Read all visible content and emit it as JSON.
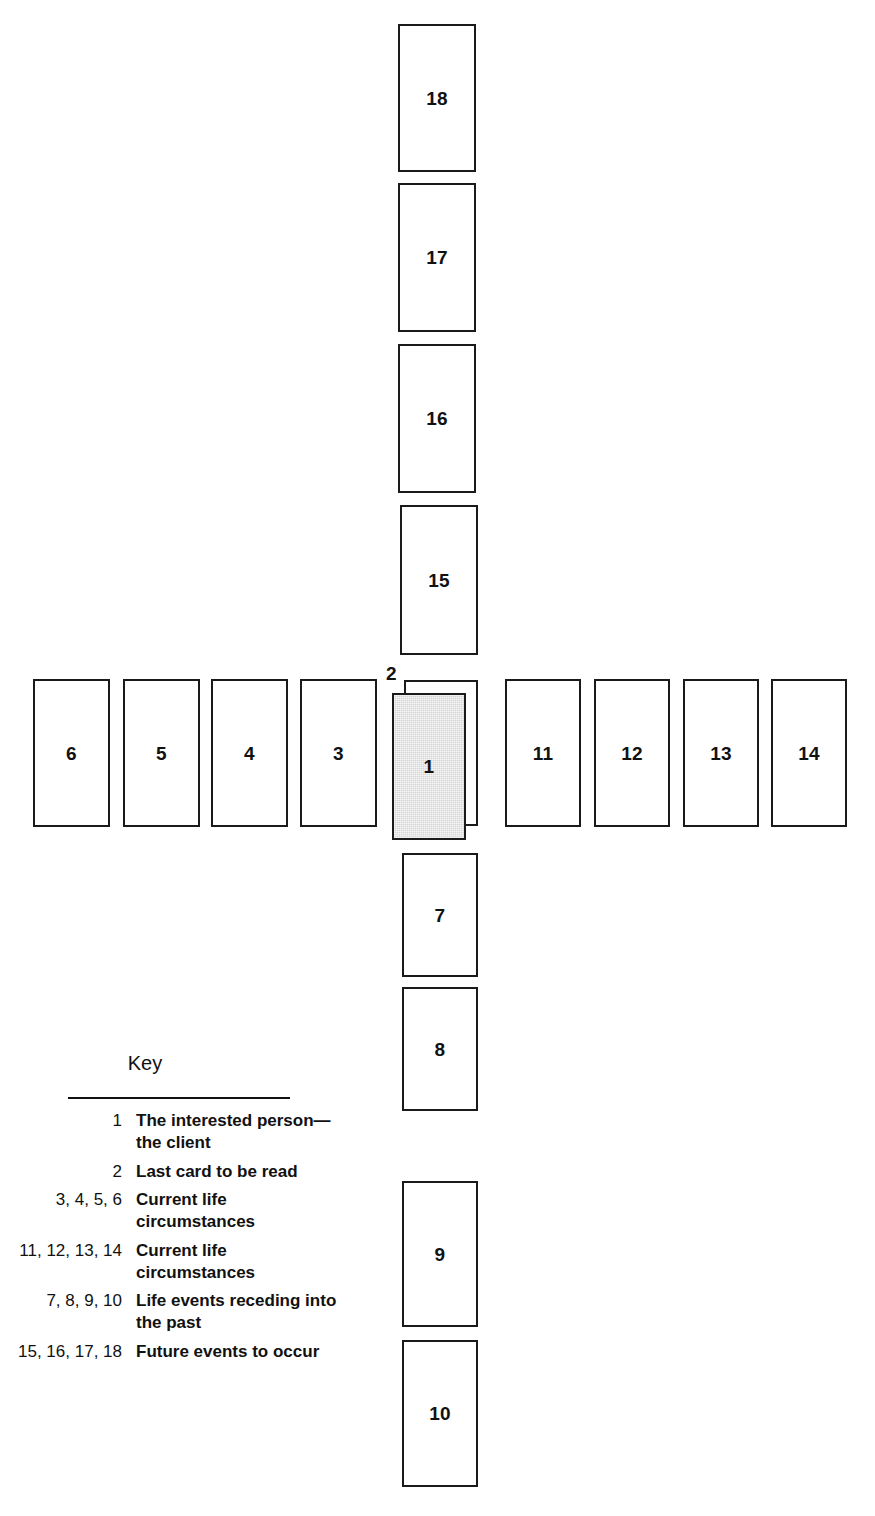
{
  "diagram": {
    "card_fill_default": "#ffffff",
    "card_fill_highlight": "#d4d4d4",
    "card_border_color": "#1a1a1a",
    "cards": [
      {
        "id": "card-18",
        "label": "18",
        "x": 398,
        "y": 24,
        "w": 78,
        "h": 148,
        "fill": "white"
      },
      {
        "id": "card-17",
        "label": "17",
        "x": 398,
        "y": 183,
        "w": 78,
        "h": 149,
        "fill": "white"
      },
      {
        "id": "card-16",
        "label": "16",
        "x": 398,
        "y": 344,
        "w": 78,
        "h": 149,
        "fill": "white"
      },
      {
        "id": "card-15",
        "label": "15",
        "x": 400,
        "y": 505,
        "w": 78,
        "h": 150,
        "fill": "white"
      },
      {
        "id": "card-6",
        "label": "6",
        "x": 33,
        "y": 679,
        "w": 77,
        "h": 148,
        "fill": "white"
      },
      {
        "id": "card-5",
        "label": "5",
        "x": 123,
        "y": 679,
        "w": 77,
        "h": 148,
        "fill": "white"
      },
      {
        "id": "card-4",
        "label": "4",
        "x": 211,
        "y": 679,
        "w": 77,
        "h": 148,
        "fill": "white"
      },
      {
        "id": "card-3",
        "label": "3",
        "x": 300,
        "y": 679,
        "w": 77,
        "h": 148,
        "fill": "white"
      },
      {
        "id": "card-2",
        "label": "2",
        "x": 404,
        "y": 680,
        "w": 74,
        "h": 146,
        "fill": "white",
        "behind": true,
        "label_outside": true,
        "label_x": 386,
        "label_y": 664
      },
      {
        "id": "card-1",
        "label": "1",
        "x": 392,
        "y": 693,
        "w": 74,
        "h": 147,
        "fill": "gray"
      },
      {
        "id": "card-11",
        "label": "11",
        "x": 505,
        "y": 679,
        "w": 76,
        "h": 148,
        "fill": "white"
      },
      {
        "id": "card-12",
        "label": "12",
        "x": 594,
        "y": 679,
        "w": 76,
        "h": 148,
        "fill": "white"
      },
      {
        "id": "card-13",
        "label": "13",
        "x": 683,
        "y": 679,
        "w": 76,
        "h": 148,
        "fill": "white"
      },
      {
        "id": "card-14",
        "label": "14",
        "x": 771,
        "y": 679,
        "w": 76,
        "h": 148,
        "fill": "white"
      },
      {
        "id": "card-7",
        "label": "7",
        "x": 402,
        "y": 853,
        "w": 76,
        "h": 124,
        "fill": "white"
      },
      {
        "id": "card-8",
        "label": "8",
        "x": 402,
        "y": 987,
        "w": 76,
        "h": 124,
        "fill": "white"
      },
      {
        "id": "card-9",
        "label": "9",
        "x": 402,
        "y": 1181,
        "w": 76,
        "h": 146,
        "fill": "white"
      },
      {
        "id": "card-10",
        "label": "10",
        "x": 402,
        "y": 1340,
        "w": 76,
        "h": 147,
        "fill": "white"
      }
    ]
  },
  "key": {
    "title": "Key",
    "rows": [
      {
        "numbers": "1",
        "label": "The interested person—\nthe client"
      },
      {
        "numbers": "2",
        "label": "Last card to be read"
      },
      {
        "numbers": "3, 4, 5, 6",
        "label": "Current life circumstances"
      },
      {
        "numbers": "11, 12, 13, 14",
        "label": "Current life circumstances"
      },
      {
        "numbers": "7, 8, 9, 10",
        "label": "Life events receding into\nthe past"
      },
      {
        "numbers": "15, 16, 17, 18",
        "label": "Future events to occur"
      }
    ]
  }
}
